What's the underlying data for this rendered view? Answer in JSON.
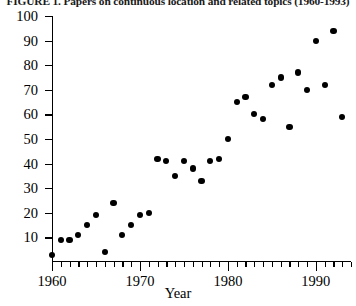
{
  "figure": {
    "title": "FIGURE 1. Papers on continuous location and related topics (1960-1993)",
    "axis_title_x": "Year"
  },
  "chart_data": {
    "type": "scatter",
    "title": "FIGURE 1. Papers on continuous location and related topics (1960-1993)",
    "xlabel": "Year",
    "ylabel": "",
    "xlim": [
      1960,
      1994
    ],
    "ylim": [
      0,
      100
    ],
    "grid": false,
    "legend": null,
    "marker": "filled-circle",
    "marker_color": "#000000",
    "x_ticks_major": [
      1960,
      1970,
      1980,
      1990
    ],
    "x_tick_labels": [
      "1960",
      "1970",
      "1980",
      "1990"
    ],
    "x_minor_tick_interval": 1,
    "y_ticks": [
      10,
      20,
      30,
      40,
      50,
      60,
      70,
      80,
      90,
      100
    ],
    "y_tick_labels": [
      "10",
      "20",
      "30",
      "40",
      "50",
      "60",
      "70",
      "80",
      "90",
      "100"
    ],
    "x": [
      1960,
      1961,
      1962,
      1963,
      1964,
      1965,
      1966,
      1967,
      1968,
      1969,
      1970,
      1971,
      1972,
      1973,
      1974,
      1975,
      1976,
      1977,
      1978,
      1979,
      1980,
      1981,
      1982,
      1983,
      1984,
      1985,
      1986,
      1987,
      1988,
      1989,
      1990,
      1991,
      1992,
      1993
    ],
    "y": [
      3,
      9,
      9,
      11,
      15,
      19,
      4,
      24,
      11,
      15,
      19,
      20,
      42,
      41,
      35,
      41,
      38,
      33,
      41,
      42,
      50,
      65,
      67,
      60,
      58,
      72,
      75,
      55,
      77,
      70,
      90,
      72,
      94,
      59
    ],
    "points": [
      {
        "year": 1960,
        "value": 3
      },
      {
        "year": 1961,
        "value": 9
      },
      {
        "year": 1962,
        "value": 9
      },
      {
        "year": 1963,
        "value": 11
      },
      {
        "year": 1964,
        "value": 15
      },
      {
        "year": 1965,
        "value": 19
      },
      {
        "year": 1966,
        "value": 4
      },
      {
        "year": 1967,
        "value": 24
      },
      {
        "year": 1968,
        "value": 11
      },
      {
        "year": 1969,
        "value": 15
      },
      {
        "year": 1970,
        "value": 19
      },
      {
        "year": 1971,
        "value": 20
      },
      {
        "year": 1972,
        "value": 42
      },
      {
        "year": 1973,
        "value": 41
      },
      {
        "year": 1974,
        "value": 35
      },
      {
        "year": 1975,
        "value": 41
      },
      {
        "year": 1976,
        "value": 38
      },
      {
        "year": 1977,
        "value": 33
      },
      {
        "year": 1978,
        "value": 41
      },
      {
        "year": 1979,
        "value": 42
      },
      {
        "year": 1980,
        "value": 50
      },
      {
        "year": 1981,
        "value": 65
      },
      {
        "year": 1982,
        "value": 67
      },
      {
        "year": 1983,
        "value": 60
      },
      {
        "year": 1984,
        "value": 58
      },
      {
        "year": 1985,
        "value": 72
      },
      {
        "year": 1986,
        "value": 75
      },
      {
        "year": 1987,
        "value": 55
      },
      {
        "year": 1988,
        "value": 77
      },
      {
        "year": 1989,
        "value": 70
      },
      {
        "year": 1990,
        "value": 90
      },
      {
        "year": 1991,
        "value": 72
      },
      {
        "year": 1992,
        "value": 94
      },
      {
        "year": 1993,
        "value": 59
      }
    ]
  }
}
